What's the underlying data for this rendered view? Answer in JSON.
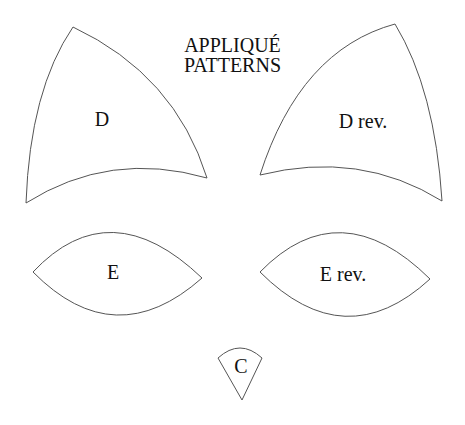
{
  "title": {
    "line1": "APPLIQUÉ",
    "line2": "PATTERNS"
  },
  "pieces": [
    {
      "id": "D",
      "label": "D"
    },
    {
      "id": "D-rev",
      "label": "D rev."
    },
    {
      "id": "E",
      "label": "E"
    },
    {
      "id": "E-rev",
      "label": "E rev."
    },
    {
      "id": "C",
      "label": "C"
    }
  ],
  "colors": {
    "outline": "#555555",
    "text": "#111111",
    "background": "#ffffff"
  }
}
